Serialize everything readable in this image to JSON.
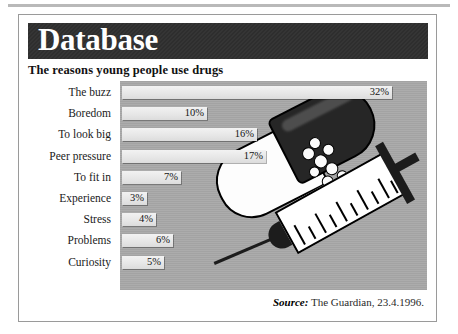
{
  "page": {
    "banner_title": "Database",
    "subtitle": "The reasons young people use drugs",
    "source_label": "Source",
    "source_separator": ":",
    "source_text": "The Guardian,  23.4.1996.",
    "colors": {
      "banner_bg": "#2e2e2e",
      "banner_text": "#ffffff",
      "plot_bg": "#a8a8a8",
      "bar_fill": "#e9e9e9",
      "card_bg": "#ffffff",
      "frame": "#9a9a9a",
      "text": "#1a1a1a"
    }
  },
  "illustrations": [
    {
      "name": "drug-capsule",
      "description": "opened two-tone capsule spilling granules"
    },
    {
      "name": "syringe",
      "description": "graduated syringe with needle and plunger"
    }
  ],
  "chart_data": {
    "type": "bar",
    "orientation": "horizontal",
    "title": "The reasons young people use drugs",
    "xlabel": "",
    "ylabel": "",
    "xlim": [
      0,
      34
    ],
    "grid": false,
    "legend": null,
    "value_suffix": "%",
    "categories": [
      "The buzz",
      "Boredom",
      "To look big",
      "Peer pressure",
      "To fit in",
      "Experience",
      "Stress",
      "Problems",
      "Curiosity"
    ],
    "values": [
      32,
      10,
      16,
      17,
      7,
      3,
      4,
      6,
      5
    ],
    "value_labels": [
      "32%",
      "10%",
      "16%",
      "17%",
      "7%",
      "3%",
      "4%",
      "6%",
      "5%"
    ]
  }
}
